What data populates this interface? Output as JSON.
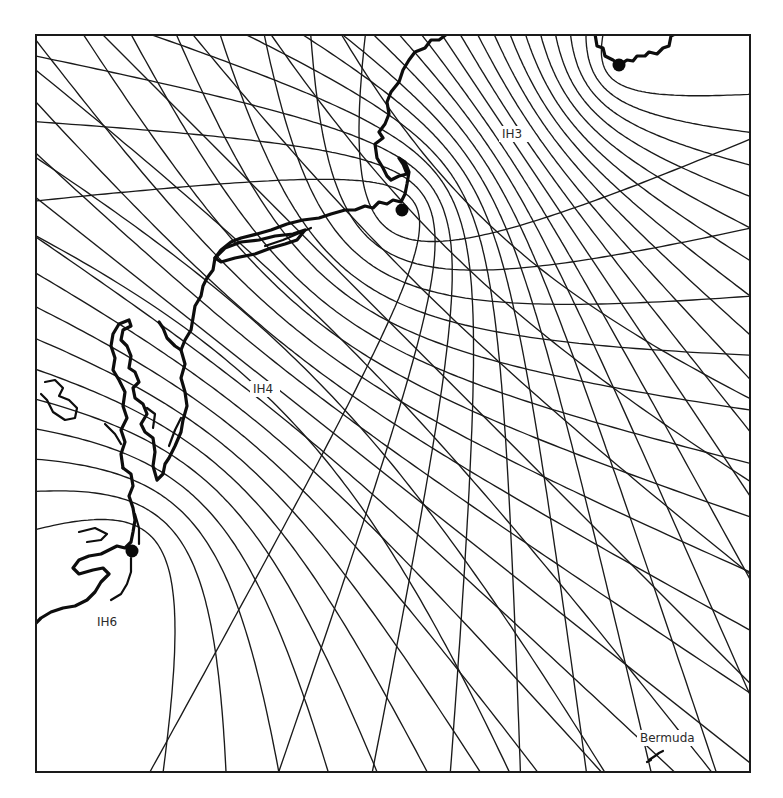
{
  "map": {
    "type": "hyperbolic-navigation-chart",
    "width": 716,
    "height": 739,
    "colors": {
      "line": "#1a1a1a",
      "coast": "#0d0d0d",
      "background": "#ffffff"
    },
    "stations": [
      {
        "id": "nova-scotia",
        "x": 584,
        "y": 31
      },
      {
        "id": "cape-cod",
        "x": 367,
        "y": 176
      },
      {
        "id": "cape-hatteras",
        "x": 97,
        "y": 517
      }
    ],
    "pair_labels": [
      {
        "text": "IH3",
        "x": 467,
        "y": 104
      },
      {
        "text": "IH4",
        "x": 218,
        "y": 359
      },
      {
        "text": "IH6",
        "x": 62,
        "y": 592
      }
    ],
    "places": [
      {
        "text": "Bermuda",
        "x": 605,
        "y": 708
      }
    ],
    "families": [
      {
        "name": "IH3",
        "a": 0,
        "b": 1,
        "count": 22,
        "spread": 1.0
      },
      {
        "name": "IH4",
        "a": 1,
        "b": 2,
        "count": 22,
        "spread": 1.0
      },
      {
        "name": "IH6",
        "a": 2,
        "b": 0,
        "count": 8,
        "spread": 0.55
      }
    ]
  }
}
